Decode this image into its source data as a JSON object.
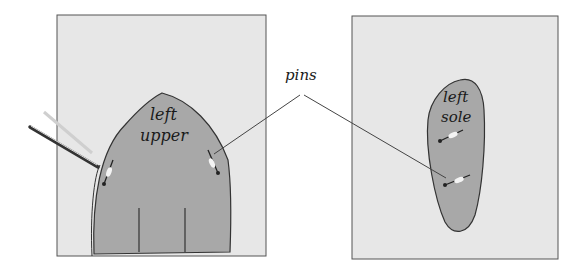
{
  "figure": {
    "panels": [
      {
        "id": "left-panel",
        "shape_label_line1": "left",
        "shape_label_line2": "upper"
      },
      {
        "id": "right-panel",
        "shape_label_line1": "left",
        "shape_label_line2": "sole"
      }
    ],
    "callout_label": "pins",
    "colors": {
      "paper": "#e6e6e6",
      "shape": "#a9a9a9",
      "outline": "#333333",
      "background": "#ffffff"
    }
  }
}
